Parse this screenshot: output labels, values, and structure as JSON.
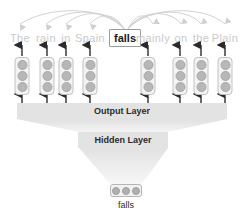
{
  "diagram": {
    "background_color": "#ffffff",
    "width": 248,
    "height": 219
  },
  "colors": {
    "word_dim": "#c9c9c9",
    "word_focus": "#1a1a1a",
    "cell_fill": "#b7b7b7",
    "cell_box": "#f3f3f3",
    "layer_bar": "#e3e3e3",
    "funnel": "#ededed",
    "arrow": "#2b2b2b",
    "arc": "#d2d2d2"
  },
  "sentence": {
    "words": [
      {
        "text": "The",
        "x": 20,
        "focus": false,
        "has_stack": true,
        "stack_x": 22
      },
      {
        "text": "rain",
        "x": 46,
        "focus": false,
        "has_stack": true,
        "stack_x": 47
      },
      {
        "text": "in",
        "x": 66,
        "focus": false,
        "has_stack": true,
        "stack_x": 66
      },
      {
        "text": "Spain",
        "x": 90,
        "focus": false,
        "has_stack": true,
        "stack_x": 90
      },
      {
        "text": "falls",
        "x": 125,
        "focus": true,
        "has_stack": false,
        "stack_x": null
      },
      {
        "text": "mainly",
        "x": 153,
        "focus": false,
        "has_stack": true,
        "stack_x": 148
      },
      {
        "text": "on",
        "x": 181,
        "focus": false,
        "has_stack": true,
        "stack_x": 180
      },
      {
        "text": "the",
        "x": 201,
        "focus": false,
        "has_stack": true,
        "stack_x": 201
      },
      {
        "text": "Plain",
        "x": 225,
        "focus": false,
        "has_stack": true,
        "stack_x": 225
      }
    ],
    "word_row_y": 38,
    "focus_word": "falls"
  },
  "cells": {
    "units_per_stack": 3,
    "stack_top_y": 57,
    "stack_height": 38
  },
  "layers": {
    "output": {
      "label": "Output Layer",
      "x": 122,
      "y": 103,
      "width": 210,
      "height": 16
    },
    "hidden": {
      "label": "Hidden Layer",
      "x": 123,
      "y": 132,
      "width": 90,
      "height": 16
    }
  },
  "input": {
    "units": 3,
    "label": "falls",
    "cell_x": 126,
    "cell_y": 184,
    "label_x": 126,
    "label_y": 202
  },
  "arrows": {
    "word_arrow_count": 8,
    "layer_arrow_count": 8,
    "attention_arc_count": 8,
    "attention_source": "falls",
    "direction_up": "upward",
    "direction_arc": "downward-arrowhead"
  }
}
